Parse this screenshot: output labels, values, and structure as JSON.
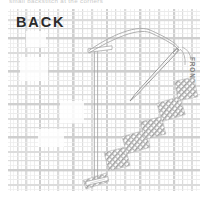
{
  "diagram": {
    "type": "embroidery-stitch-diagram",
    "technique": "backstitch",
    "top_caption": "small backstitch at the corners",
    "labels": {
      "back": "BACK",
      "front": "FRONT"
    },
    "colors": {
      "fabric_weave_light": "#ececec",
      "fabric_weave_mid": "#dcdcdc",
      "fabric_weave_dark": "#cfcfcf",
      "thread_line": "#a8a8a8",
      "needle_outline": "#8f8f8f",
      "stitch_fill": "#9a9a9a",
      "back_text": "#2b2b2b",
      "front_text": "#7e7e7e",
      "caption_text": "#c9c9c9",
      "page_background": "#ffffff"
    },
    "fabric": {
      "name": "plaid-woven-ground",
      "x": 8,
      "y": 9,
      "width": 192,
      "height": 182,
      "vertical_bands": [
        {
          "x": 2,
          "w": 1.0,
          "tone": "light"
        },
        {
          "x": 5,
          "w": 0.7,
          "tone": "light"
        },
        {
          "x": 9,
          "w": 1.6,
          "tone": "mid"
        },
        {
          "x": 13,
          "w": 0.7,
          "tone": "light"
        },
        {
          "x": 17,
          "w": 2.4,
          "tone": "mid"
        },
        {
          "x": 22,
          "w": 0.7,
          "tone": "light"
        },
        {
          "x": 26,
          "w": 1.0,
          "tone": "light"
        },
        {
          "x": 31,
          "w": 2.0,
          "tone": "dark"
        },
        {
          "x": 36,
          "w": 0.7,
          "tone": "light"
        },
        {
          "x": 40,
          "w": 1.2,
          "tone": "mid"
        },
        {
          "x": 45,
          "w": 0.7,
          "tone": "light"
        },
        {
          "x": 49,
          "w": 2.2,
          "tone": "mid"
        },
        {
          "x": 55,
          "w": 0.7,
          "tone": "light"
        },
        {
          "x": 59,
          "w": 1.0,
          "tone": "light"
        },
        {
          "x": 64,
          "w": 2.6,
          "tone": "dark"
        },
        {
          "x": 70,
          "w": 0.7,
          "tone": "light"
        },
        {
          "x": 74,
          "w": 1.2,
          "tone": "mid"
        },
        {
          "x": 79,
          "w": 0.7,
          "tone": "light"
        },
        {
          "x": 83,
          "w": 2.2,
          "tone": "mid"
        },
        {
          "x": 89,
          "w": 0.7,
          "tone": "light"
        },
        {
          "x": 93,
          "w": 1.0,
          "tone": "light"
        },
        {
          "x": 98,
          "w": 2.0,
          "tone": "dark"
        },
        {
          "x": 103,
          "w": 0.7,
          "tone": "light"
        },
        {
          "x": 107,
          "w": 1.3,
          "tone": "mid"
        },
        {
          "x": 112,
          "w": 0.7,
          "tone": "light"
        },
        {
          "x": 116,
          "w": 2.3,
          "tone": "mid"
        },
        {
          "x": 122,
          "w": 0.7,
          "tone": "light"
        },
        {
          "x": 126,
          "w": 1.0,
          "tone": "light"
        },
        {
          "x": 131,
          "w": 2.4,
          "tone": "dark"
        },
        {
          "x": 137,
          "w": 0.7,
          "tone": "light"
        },
        {
          "x": 141,
          "w": 1.2,
          "tone": "mid"
        },
        {
          "x": 146,
          "w": 0.7,
          "tone": "light"
        },
        {
          "x": 150,
          "w": 2.2,
          "tone": "mid"
        },
        {
          "x": 156,
          "w": 0.7,
          "tone": "light"
        },
        {
          "x": 160,
          "w": 1.0,
          "tone": "light"
        },
        {
          "x": 165,
          "w": 2.2,
          "tone": "dark"
        },
        {
          "x": 170,
          "w": 0.7,
          "tone": "light"
        },
        {
          "x": 174,
          "w": 1.2,
          "tone": "mid"
        },
        {
          "x": 179,
          "w": 0.7,
          "tone": "light"
        },
        {
          "x": 183,
          "w": 2.0,
          "tone": "mid"
        },
        {
          "x": 188,
          "w": 0.7,
          "tone": "light"
        }
      ],
      "horizontal_bands": [
        {
          "y": 2,
          "h": 1.0,
          "tone": "light"
        },
        {
          "y": 6,
          "h": 0.7,
          "tone": "light"
        },
        {
          "y": 10,
          "h": 2.2,
          "tone": "mid"
        },
        {
          "y": 15,
          "h": 0.7,
          "tone": "light"
        },
        {
          "y": 19,
          "h": 1.2,
          "tone": "mid"
        },
        {
          "y": 24,
          "h": 0.7,
          "tone": "light"
        },
        {
          "y": 28,
          "h": 2.4,
          "tone": "dark"
        },
        {
          "y": 34,
          "h": 0.7,
          "tone": "light"
        },
        {
          "y": 38,
          "h": 1.0,
          "tone": "light"
        },
        {
          "y": 43,
          "h": 2.0,
          "tone": "mid"
        },
        {
          "y": 48,
          "h": 0.7,
          "tone": "light"
        },
        {
          "y": 52,
          "h": 1.2,
          "tone": "mid"
        },
        {
          "y": 57,
          "h": 0.7,
          "tone": "light"
        },
        {
          "y": 61,
          "h": 2.6,
          "tone": "dark"
        },
        {
          "y": 67,
          "h": 0.7,
          "tone": "light"
        },
        {
          "y": 71,
          "h": 1.0,
          "tone": "light"
        },
        {
          "y": 76,
          "h": 2.0,
          "tone": "mid"
        },
        {
          "y": 81,
          "h": 0.7,
          "tone": "light"
        },
        {
          "y": 85,
          "h": 1.3,
          "tone": "mid"
        },
        {
          "y": 90,
          "h": 0.7,
          "tone": "light"
        },
        {
          "y": 94,
          "h": 2.4,
          "tone": "dark"
        },
        {
          "y": 100,
          "h": 0.7,
          "tone": "light"
        },
        {
          "y": 104,
          "h": 1.0,
          "tone": "light"
        },
        {
          "y": 109,
          "h": 2.0,
          "tone": "mid"
        },
        {
          "y": 114,
          "h": 0.7,
          "tone": "light"
        },
        {
          "y": 118,
          "h": 1.2,
          "tone": "mid"
        },
        {
          "y": 123,
          "h": 0.7,
          "tone": "light"
        },
        {
          "y": 127,
          "h": 2.5,
          "tone": "dark"
        },
        {
          "y": 133,
          "h": 0.7,
          "tone": "light"
        },
        {
          "y": 137,
          "h": 1.0,
          "tone": "light"
        },
        {
          "y": 142,
          "h": 2.0,
          "tone": "mid"
        },
        {
          "y": 147,
          "h": 0.7,
          "tone": "light"
        },
        {
          "y": 151,
          "h": 1.2,
          "tone": "mid"
        },
        {
          "y": 156,
          "h": 0.7,
          "tone": "light"
        },
        {
          "y": 160,
          "h": 2.4,
          "tone": "dark"
        },
        {
          "y": 166,
          "h": 0.7,
          "tone": "light"
        },
        {
          "y": 170,
          "h": 1.0,
          "tone": "light"
        },
        {
          "y": 175,
          "h": 2.0,
          "tone": "mid"
        },
        {
          "y": 180,
          "h": 0.7,
          "tone": "light"
        }
      ],
      "blank_patches": [
        {
          "x": 18,
          "y": 22,
          "w": 20,
          "h": 16
        },
        {
          "x": 12,
          "y": 48,
          "w": 28,
          "h": 24
        },
        {
          "x": 52,
          "y": 92,
          "w": 24,
          "h": 22
        },
        {
          "x": 30,
          "y": 120,
          "w": 26,
          "h": 18
        }
      ]
    },
    "stitch_blocks": [
      {
        "name": "stitch-block-1",
        "cx": 96,
        "cy": 181,
        "w": 24,
        "h": 9,
        "angle": -18
      },
      {
        "name": "stitch-block-2",
        "cx": 117,
        "cy": 159,
        "w": 22,
        "h": 19,
        "angle": -14
      },
      {
        "name": "stitch-block-3",
        "cx": 136,
        "cy": 142,
        "w": 24,
        "h": 18,
        "angle": -16
      },
      {
        "name": "stitch-block-4",
        "cx": 153,
        "cy": 128,
        "w": 22,
        "h": 18,
        "angle": -14
      },
      {
        "name": "stitch-block-5",
        "cx": 171,
        "cy": 109,
        "w": 24,
        "h": 19,
        "angle": -17
      },
      {
        "name": "stitch-block-6",
        "cx": 186,
        "cy": 89,
        "w": 20,
        "h": 20,
        "angle": -12
      }
    ],
    "thread": {
      "name": "working-thread",
      "vertical_run": {
        "x": 96,
        "y_top": 51,
        "y_bottom": 180
      },
      "top_stitch": {
        "x1": 88,
        "y1": 50,
        "x2": 112,
        "y2": 47
      },
      "bottom_stitch": {
        "x1": 86,
        "y1": 183,
        "x2": 108,
        "y2": 178
      },
      "loop_path": "curve from top stitch up and right to needle eye"
    },
    "needle": {
      "name": "sewing-needle",
      "eye_x": 178,
      "eye_y": 49,
      "tip_x": 130,
      "tip_y": 101,
      "length": 70,
      "width": 3.2
    }
  }
}
